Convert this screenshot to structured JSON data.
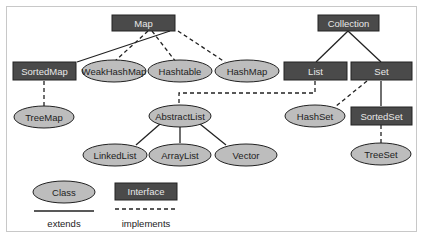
{
  "diagram": {
    "interfaces": {
      "map": "Map",
      "sorted_map": "SortedMap",
      "collection": "Collection",
      "list": "List",
      "set": "Set",
      "sorted_set": "SortedSet"
    },
    "classes": {
      "weak_hash_map": "WeakHashMap",
      "hashtable": "Hashtable",
      "hash_map": "HashMap",
      "tree_map": "TreeMap",
      "abstract_list": "AbstractList",
      "linked_list": "LinkedList",
      "array_list": "ArrayList",
      "vector": "Vector",
      "hash_set": "HashSet",
      "tree_set": "TreeSet"
    },
    "relationships": [
      {
        "from": "SortedMap",
        "to": "Map",
        "type": "extends"
      },
      {
        "from": "WeakHashMap",
        "to": "Map",
        "type": "implements"
      },
      {
        "from": "Hashtable",
        "to": "Map",
        "type": "implements"
      },
      {
        "from": "HashMap",
        "to": "Map",
        "type": "implements"
      },
      {
        "from": "TreeMap",
        "to": "SortedMap",
        "type": "implements"
      },
      {
        "from": "List",
        "to": "Collection",
        "type": "extends"
      },
      {
        "from": "Set",
        "to": "Collection",
        "type": "extends"
      },
      {
        "from": "AbstractList",
        "to": "List",
        "type": "implements"
      },
      {
        "from": "LinkedList",
        "to": "AbstractList",
        "type": "extends"
      },
      {
        "from": "ArrayList",
        "to": "AbstractList",
        "type": "extends"
      },
      {
        "from": "Vector",
        "to": "AbstractList",
        "type": "extends"
      },
      {
        "from": "HashSet",
        "to": "Set",
        "type": "implements"
      },
      {
        "from": "SortedSet",
        "to": "Set",
        "type": "extends"
      },
      {
        "from": "TreeSet",
        "to": "SortedSet",
        "type": "implements"
      }
    ]
  },
  "legend": {
    "class_label": "Class",
    "interface_label": "Interface",
    "extends_label": "extends",
    "implements_label": "implements"
  },
  "colors": {
    "interface_fill": "#4a4a4a",
    "class_fill": "#bdbdbd",
    "line": "#222222"
  }
}
